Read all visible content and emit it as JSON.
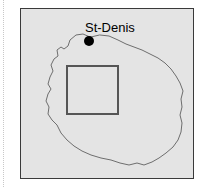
{
  "figure": {
    "name": "reunion-island-locator-map",
    "canvas": {
      "width": 205,
      "height": 187
    },
    "background_color": "#ffffff",
    "margin_rule": {
      "color": "#c8c8c8",
      "style": "dotted",
      "x": 3
    }
  },
  "map": {
    "frame": {
      "x": 20,
      "y": 8,
      "width": 174,
      "height": 171,
      "fill_color": "#e4e4e4",
      "border_color": "#3a3a3a"
    },
    "coastline": {
      "label": "island-coastline",
      "stroke_color": "#6e6e6e",
      "points": "69,28 62,25 55,26 49,31 47,37 43,40 40,38 36,41 37,47 33,50 30,56 32,62 29,68 27,75 30,80 27,85 25,92 28,98 27,105 31,111 36,116 40,124 46,131 53,137 61,142 70,146 80,149 90,151 99,154 108,156 116,154 123,156 131,153 138,149 145,144 152,138 157,131 160,123 161,114 159,106 161,98 160,90 162,82 159,74 155,67 150,60 144,54 137,49 129,45 121,41 113,38 105,35 97,31 88,27 79,26"
    },
    "study_area_rect": {
      "label": "study-area-rectangle",
      "x": 46,
      "y": 57,
      "width": 51,
      "height": 48,
      "stroke_color": "#555555"
    },
    "city": {
      "name": "St-Denis",
      "dot": {
        "x": 68,
        "y": 32,
        "radius": 5,
        "color": "#000000"
      },
      "label_x": 64,
      "label_y": 23
    }
  }
}
